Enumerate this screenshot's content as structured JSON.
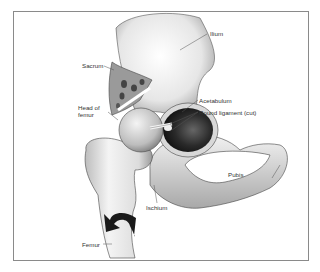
{
  "figure": {
    "labels": {
      "ilium": "Ilium",
      "sacrum": "Sacrum",
      "acetabulum": "Acetabulum",
      "round_ligament": "Round ligament (cut)",
      "head_of_femur_line1": "Head of",
      "head_of_femur_line2": "femur",
      "pubis": "Pubis",
      "ischium": "Ischium",
      "femur": "Femur"
    },
    "colors": {
      "frame": "#8a8a8a",
      "bone_light": "#f2f2f2",
      "bone_shade": "#9a9a9a",
      "socket_dark": "#222222",
      "arrow": "#1a1a1a"
    }
  }
}
